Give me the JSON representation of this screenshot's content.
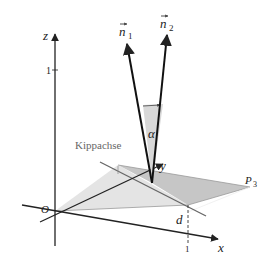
{
  "figure": {
    "axes": {
      "x_label": "x",
      "y_label": "y",
      "z_label": "z",
      "origin_label": "O",
      "z_tick": "1",
      "x_tick": "1",
      "y_tick": "1"
    },
    "vectors": {
      "n1_label": "n",
      "n1_sub": "1",
      "n2_label": "n",
      "n2_sub": "2"
    },
    "angle_label": "α",
    "axis_label": "Kippachse",
    "point_label": "P",
    "point_sub": "3",
    "distance_label": "d",
    "colors": {
      "light_plane": "#e4e4e4",
      "dark_plane": "#c8c8c8",
      "angle_fill": "#d8d8d8",
      "lines": "#222222",
      "kippachse": "#666666"
    }
  }
}
